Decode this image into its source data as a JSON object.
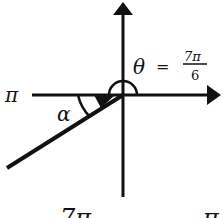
{
  "diagram": {
    "type": "angle-on-axes",
    "axes": {
      "origin": [
        123,
        95
      ],
      "horizontal_left_label": "π",
      "colors": {
        "stroke": "#111111",
        "background": "#ffffff"
      }
    },
    "theta": {
      "symbol": "θ",
      "equals": "=",
      "numerator": "7π",
      "denominator": "6"
    },
    "reference_angle": {
      "symbol": "α"
    },
    "bottom_partial_text": {
      "left": "7π",
      "right": "π"
    }
  }
}
